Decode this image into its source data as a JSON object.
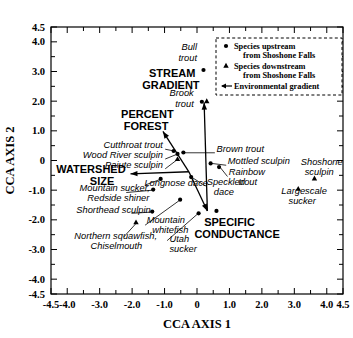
{
  "chart_data": {
    "type": "scatter",
    "title": "",
    "xlabel": "CCA AXIS 1",
    "ylabel": "CCA AXIS 2",
    "xlim": [
      -4.5,
      4.5
    ],
    "ylim": [
      -4.5,
      4.5
    ],
    "grid": false,
    "xticklabels": [
      "-4.5",
      "-4.0",
      "-3.0",
      "-2.0",
      "-1.0",
      "0",
      "1.0",
      "2.0",
      "3.0",
      "4.0",
      "4.5"
    ],
    "xtickvalues": [
      -4.5,
      -4.0,
      -3.0,
      -2.0,
      -1.0,
      0,
      1.0,
      2.0,
      3.0,
      4.0,
      4.5
    ],
    "yticklabels": [
      "4.5",
      "4.0",
      "3.0",
      "2.0",
      "1.0",
      "0",
      "-1.0",
      "-2.0",
      "-3.0",
      "-4.0",
      "-4.5"
    ],
    "ytickvalues": [
      4.5,
      4.0,
      3.0,
      2.0,
      1.0,
      0,
      -1.0,
      -2.0,
      -3.0,
      -4.0,
      -4.5
    ],
    "minor_tick_step": 0.5,
    "legend_position": "top-right",
    "legend": [
      {
        "marker": "circle",
        "label_line1": "Species upstream",
        "label_line2": "from Shoshone Falls"
      },
      {
        "marker": "triangle",
        "label_line1": "Species downstream",
        "label_line2": "from Shoshone Falls"
      },
      {
        "marker": "arrow",
        "label_line1": "Environmental gradient",
        "label_line2": ""
      }
    ],
    "series": [
      {
        "name": "Species upstream from Shoshone Falls",
        "marker": "circle",
        "points": [
          {
            "label": "Bull trout",
            "x": 0.2,
            "y": 3.05
          },
          {
            "label": "Brook trout",
            "x": 0.15,
            "y": 1.98
          },
          {
            "label": "Cutthroat trout",
            "x": -0.72,
            "y": 0.32
          },
          {
            "label": "Wood River sculpin",
            "x": -0.6,
            "y": 0.22
          },
          {
            "label": "Brown trout",
            "x": -0.42,
            "y": 0.27
          },
          {
            "label": "Mottled sculpin",
            "x": 0.42,
            "y": -0.1
          },
          {
            "label": "Rainbow trout",
            "x": 0.68,
            "y": -0.22
          },
          {
            "label": "Longnose dace",
            "x": -1.12,
            "y": -0.62
          },
          {
            "label": "Speckled dace",
            "x": -0.18,
            "y": -0.56
          },
          {
            "label": "Mountain sucker, Redside shiner",
            "x": -1.35,
            "y": -0.98
          },
          {
            "label": "Shorthead sculpin",
            "x": -1.38,
            "y": -1.72
          },
          {
            "label": "Utah sucker",
            "x": -0.52,
            "y": -1.32
          },
          {
            "label": "Speckled dace lower",
            "x": 0.05,
            "y": -1.78
          },
          {
            "label": "Unlabeled node",
            "x": 0.6,
            "y": -1.7
          }
        ]
      },
      {
        "name": "Species downstream from Shoshone Falls",
        "marker": "triangle",
        "points": [
          {
            "label": "Brook trout (downstream)",
            "x": 0.3,
            "y": 2.0
          },
          {
            "label": "Paiute sculpin",
            "x": -0.6,
            "y": 0.05
          },
          {
            "label": "Northern squawfish, Chiselmouth",
            "x": -1.88,
            "y": -2.08
          },
          {
            "label": "Shoshone sculpin",
            "x": 3.62,
            "y": -0.6
          },
          {
            "label": "Largescale sucker",
            "x": 3.12,
            "y": -0.95
          }
        ]
      }
    ],
    "gradients": [
      {
        "label": "STREAM GRADIENT",
        "tip_x": 0.22,
        "tip_y": 1.95,
        "tail_x": 0.32,
        "tail_y": -1.7
      },
      {
        "label": "PERCENT FOREST",
        "tip_x": -1.05,
        "tip_y": 0.98,
        "tail_x": -0.25,
        "tail_y": -0.38
      },
      {
        "label": "WATERSHED SIZE",
        "tip_x": -2.05,
        "tip_y": -0.45,
        "tail_x": -0.25,
        "tail_y": -0.38
      },
      {
        "label": "SPECIFIC CONDUCTANCE",
        "tip_x": 0.32,
        "tip_y": -1.7,
        "tail_x": -0.25,
        "tail_y": -0.38
      }
    ],
    "species_labels": [
      {
        "text": "Bull",
        "x": 0.0,
        "y": 3.72,
        "align": "end",
        "style": "italic"
      },
      {
        "text": "trout",
        "x": 0.0,
        "y": 3.36,
        "align": "end",
        "style": "italic"
      },
      {
        "text": "Brook",
        "x": -0.1,
        "y": 2.18,
        "align": "end",
        "style": "italic"
      },
      {
        "text": "trout",
        "x": -0.1,
        "y": 1.82,
        "align": "end",
        "style": "italic"
      },
      {
        "text": "Cutthroat trout",
        "x": -1.05,
        "y": 0.42,
        "align": "end",
        "style": "italic"
      },
      {
        "text": "Wood River sculpin",
        "x": -1.05,
        "y": 0.08,
        "align": "end",
        "style": "italic"
      },
      {
        "text": "Paiute sculpin",
        "x": -1.05,
        "y": -0.26,
        "align": "end",
        "style": "italic"
      },
      {
        "text": "Brown trout",
        "x": 0.6,
        "y": 0.3,
        "align": "start",
        "style": "italic"
      },
      {
        "text": "Mottled sculpin",
        "x": 0.95,
        "y": -0.12,
        "align": "start",
        "style": "italic"
      },
      {
        "text": "Rainbow",
        "x": 0.98,
        "y": -0.5,
        "align": "start",
        "style": "italic"
      },
      {
        "text": "trout",
        "x": 1.28,
        "y": -0.84,
        "align": "start",
        "style": "italic"
      },
      {
        "text": "Shoshone",
        "x": 3.2,
        "y": -0.15,
        "align": "start",
        "style": "italic"
      },
      {
        "text": "sculpin",
        "x": 3.32,
        "y": -0.5,
        "align": "start",
        "style": "italic"
      },
      {
        "text": "Largescale",
        "x": 2.6,
        "y": -1.12,
        "align": "start",
        "style": "italic"
      },
      {
        "text": "sucker",
        "x": 2.82,
        "y": -1.46,
        "align": "start",
        "style": "italic"
      },
      {
        "text": "Longnose dace",
        "x": -1.62,
        "y": -0.86,
        "align": "start",
        "style": "italic"
      },
      {
        "text": "Speckled",
        "x": 0.3,
        "y": -0.82,
        "align": "start",
        "style": "italic"
      },
      {
        "text": "dace",
        "x": 0.52,
        "y": -1.16,
        "align": "start",
        "style": "italic"
      },
      {
        "text": "Mountain sucker,",
        "x": -3.62,
        "y": -1.02,
        "align": "start",
        "style": "italic"
      },
      {
        "text": "Redside shiner",
        "x": -3.38,
        "y": -1.36,
        "align": "start",
        "style": "italic"
      },
      {
        "text": "Shorthead sculpin",
        "x": -3.72,
        "y": -1.76,
        "align": "start",
        "style": "italic"
      },
      {
        "text": "Mountain",
        "x": -1.55,
        "y": -2.12,
        "align": "start",
        "style": "italic"
      },
      {
        "text": "whitefish",
        "x": -1.38,
        "y": -2.46,
        "align": "start",
        "style": "italic"
      },
      {
        "text": "Northern squawfish,",
        "x": -3.78,
        "y": -2.64,
        "align": "start",
        "style": "italic"
      },
      {
        "text": "Chiselmouth",
        "x": -3.28,
        "y": -2.98,
        "align": "start",
        "style": "italic"
      },
      {
        "text": "Utah",
        "x": -0.85,
        "y": -2.76,
        "align": "start",
        "style": "italic"
      },
      {
        "text": "sucker",
        "x": -0.85,
        "y": -3.1,
        "align": "start",
        "style": "italic"
      }
    ],
    "gradient_labels": [
      {
        "text": "STREAM",
        "x": -0.05,
        "y": 2.82,
        "align": "end"
      },
      {
        "text": "GRADIENT",
        "x": 0.08,
        "y": 2.42,
        "align": "end"
      },
      {
        "text": "PERCENT",
        "x": -0.72,
        "y": 1.42,
        "align": "end"
      },
      {
        "text": "FOREST",
        "x": -0.88,
        "y": 1.02,
        "align": "end"
      },
      {
        "text": "WATERSHED",
        "x": -2.2,
        "y": -0.42,
        "align": "end"
      },
      {
        "text": "SIZE",
        "x": -2.55,
        "y": -0.82,
        "align": "end"
      },
      {
        "text": "SPECIFIC",
        "x": 0.22,
        "y": -2.22,
        "align": "start"
      },
      {
        "text": "CONDUCTANCE",
        "x": -0.08,
        "y": -2.62,
        "align": "start"
      }
    ],
    "leader_lines": [
      {
        "from_x": -0.98,
        "from_y": 0.38,
        "to_x": -0.7,
        "to_y": 0.32
      },
      {
        "from_x": -0.98,
        "from_y": 0.05,
        "to_x": -0.64,
        "to_y": 0.2
      },
      {
        "from_x": -0.98,
        "from_y": -0.28,
        "to_x": -0.62,
        "to_y": 0.02
      },
      {
        "from_x": 0.55,
        "from_y": 0.26,
        "to_x": -0.4,
        "to_y": 0.26
      },
      {
        "from_x": 0.9,
        "from_y": -0.16,
        "to_x": 0.46,
        "to_y": -0.1
      },
      {
        "from_x": 0.94,
        "from_y": -0.54,
        "to_x": 0.72,
        "to_y": -0.24
      },
      {
        "from_x": -1.58,
        "from_y": -0.82,
        "to_x": -1.14,
        "to_y": -0.64
      },
      {
        "from_x": 0.26,
        "from_y": -0.86,
        "to_x": -0.14,
        "to_y": -0.58
      },
      {
        "from_x": -2.18,
        "from_y": -1.08,
        "to_x": -1.36,
        "to_y": -1.0
      },
      {
        "from_x": -2.02,
        "from_y": -1.78,
        "to_x": -1.42,
        "to_y": -1.74
      },
      {
        "from_x": -1.6,
        "from_y": -2.18,
        "to_x": -0.56,
        "to_y": -1.36
      },
      {
        "from_x": -2.26,
        "from_y": -2.58,
        "to_x": -1.86,
        "to_y": -2.1
      },
      {
        "from_x": -0.92,
        "from_y": -2.7,
        "to_x": 0.02,
        "to_y": -1.8
      }
    ]
  }
}
